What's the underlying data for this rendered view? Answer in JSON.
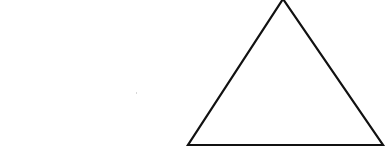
{
  "diagram": {
    "shape": "triangle",
    "kind": "equilateral-outline",
    "vertices": {
      "apex": [
        283,
        -1
      ],
      "bottom_left": [
        188,
        145
      ],
      "bottom_right": [
        383,
        145
      ]
    },
    "stroke_color": "#111111",
    "stroke_width": 2.2,
    "fill_color": "none",
    "background_color": "#ffffff"
  },
  "artifacts": {
    "speck": {
      "x": 136,
      "y": 92
    }
  }
}
